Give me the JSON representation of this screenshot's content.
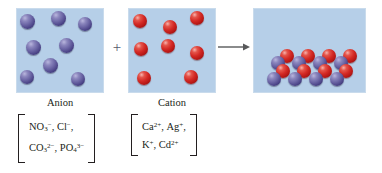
{
  "figure": {
    "operator": "+",
    "arrow": "reaction-arrow"
  },
  "colors": {
    "box_fill": "#b6cfe8",
    "box_border": "#c9dbec",
    "anion_sphere": "#4e478a",
    "cation_sphere": "#d42a25",
    "text": "#231f20",
    "arrow": "#58595b",
    "page_background": "#ffffff"
  },
  "panels": {
    "anion": {
      "caption": "Anion",
      "sphere_color_name": "purple",
      "sphere_count": 8,
      "spheres": [
        {
          "x": 20,
          "y": 14,
          "d": 15
        },
        {
          "x": 51,
          "y": 11,
          "d": 15
        },
        {
          "x": 78,
          "y": 17,
          "d": 14
        },
        {
          "x": 26,
          "y": 40,
          "d": 15
        },
        {
          "x": 59,
          "y": 38,
          "d": 15
        },
        {
          "x": 43,
          "y": 58,
          "d": 15
        },
        {
          "x": 20,
          "y": 70,
          "d": 14
        },
        {
          "x": 71,
          "y": 72,
          "d": 14
        }
      ],
      "ions": [
        [
          {
            "symbol": "NO",
            "sub": "3",
            "charge": "−"
          },
          {
            "symbol": "Cl",
            "sub": "",
            "charge": "−"
          }
        ],
        [
          {
            "symbol": "CO",
            "sub": "3",
            "charge": "2−"
          },
          {
            "symbol": "PO",
            "sub": "4",
            "charge": "3−"
          }
        ]
      ]
    },
    "cation": {
      "caption": "Cation",
      "sphere_color_name": "red",
      "sphere_count": 8,
      "spheres": [
        {
          "x": 133,
          "y": 14,
          "d": 14
        },
        {
          "x": 163,
          "y": 20,
          "d": 14
        },
        {
          "x": 190,
          "y": 11,
          "d": 14
        },
        {
          "x": 134,
          "y": 42,
          "d": 14
        },
        {
          "x": 161,
          "y": 39,
          "d": 14
        },
        {
          "x": 190,
          "y": 46,
          "d": 14
        },
        {
          "x": 137,
          "y": 71,
          "d": 14
        },
        {
          "x": 184,
          "y": 70,
          "d": 14
        }
      ],
      "ions": [
        [
          {
            "symbol": "Ca",
            "sub": "",
            "charge": "2+"
          },
          {
            "symbol": "Ag",
            "sub": "",
            "charge": "+"
          }
        ],
        [
          {
            "symbol": "K",
            "sub": "",
            "charge": "+"
          },
          {
            "symbol": "Cd",
            "sub": "",
            "charge": "2+"
          }
        ]
      ]
    },
    "product": {
      "caption": "",
      "lattice_description": "alternating red cation and purple anion ionic lattice",
      "spheres": [
        {
          "x": 280,
          "y": 49,
          "d": 14,
          "kind": "cation"
        },
        {
          "x": 301,
          "y": 49,
          "d": 14,
          "kind": "cation"
        },
        {
          "x": 322,
          "y": 49,
          "d": 14,
          "kind": "cation"
        },
        {
          "x": 343,
          "y": 49,
          "d": 14,
          "kind": "cation"
        },
        {
          "x": 271,
          "y": 56,
          "d": 14,
          "kind": "anion"
        },
        {
          "x": 292,
          "y": 56,
          "d": 14,
          "kind": "anion"
        },
        {
          "x": 313,
          "y": 56,
          "d": 14,
          "kind": "anion"
        },
        {
          "x": 334,
          "y": 56,
          "d": 14,
          "kind": "anion"
        },
        {
          "x": 276,
          "y": 64,
          "d": 14,
          "kind": "cation"
        },
        {
          "x": 297,
          "y": 64,
          "d": 14,
          "kind": "cation"
        },
        {
          "x": 318,
          "y": 64,
          "d": 14,
          "kind": "cation"
        },
        {
          "x": 339,
          "y": 64,
          "d": 14,
          "kind": "cation"
        },
        {
          "x": 267,
          "y": 72,
          "d": 14,
          "kind": "anion"
        },
        {
          "x": 288,
          "y": 72,
          "d": 14,
          "kind": "anion"
        },
        {
          "x": 309,
          "y": 72,
          "d": 14,
          "kind": "anion"
        },
        {
          "x": 330,
          "y": 72,
          "d": 14,
          "kind": "anion"
        }
      ]
    }
  }
}
